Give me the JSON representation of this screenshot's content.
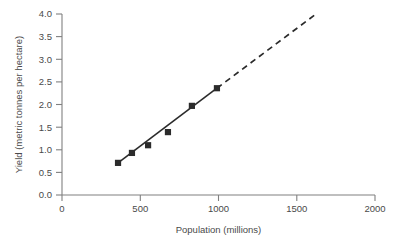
{
  "chart_data": {
    "type": "scatter",
    "title": "",
    "xlabel": "Population (millions)",
    "ylabel": "Yield (metric tonnes per hectare)",
    "xlim": [
      0,
      2000
    ],
    "ylim": [
      0.0,
      4.0
    ],
    "xticks": [
      0,
      500,
      1000,
      1500,
      2000
    ],
    "xtick_labels": [
      "0",
      "500",
      "1000",
      "1500",
      "2000"
    ],
    "yticks": [
      0.0,
      0.5,
      1.0,
      1.5,
      2.0,
      2.5,
      3.0,
      3.5,
      4.0
    ],
    "ytick_labels": [
      "0.0",
      "0.5",
      "1.0",
      "1.5",
      "2.0",
      "2.5",
      "3.0",
      "3.5",
      "4.0"
    ],
    "grid": false,
    "legend": false,
    "legend_position": "none",
    "marker_style": "filled-square",
    "series": [
      {
        "name": "Yield vs population",
        "points": [
          {
            "x": 358,
            "y": 0.71
          },
          {
            "x": 447,
            "y": 0.93
          },
          {
            "x": 550,
            "y": 1.1
          },
          {
            "x": 677,
            "y": 1.39
          },
          {
            "x": 830,
            "y": 1.97
          },
          {
            "x": 990,
            "y": 2.36
          }
        ]
      }
    ],
    "trend_line": {
      "name": "fitted-trend",
      "style": "solid",
      "x_start": 358,
      "y_start": 0.71,
      "x_end": 990,
      "y_end": 2.36
    },
    "extrapolation_line": {
      "name": "extrapolation",
      "style": "dashed",
      "x_start": 990,
      "y_start": 2.36,
      "x_end": 1623,
      "y_end": 4.0
    }
  },
  "caption": {
    "partial_text": ""
  },
  "colors": {
    "axis": "#808080",
    "data": "#2b2b2b",
    "text": "#4a4a4a",
    "background": "#ffffff"
  }
}
